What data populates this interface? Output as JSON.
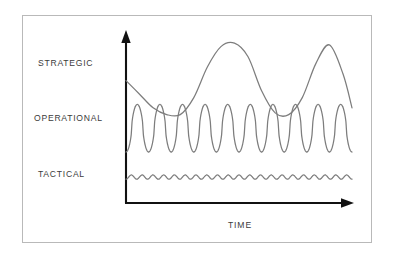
{
  "figure": {
    "background_color": "#ffffff",
    "frame_color": "#b9b9b9",
    "axis_color": "#111111",
    "curve_color": "#7d7d7d",
    "label_color": "#3b3b3b"
  },
  "labels": {
    "strategic": "STRATEGIC",
    "operational": "OPERATIONAL",
    "tactical": "TACTICAL",
    "time": "TIME"
  },
  "icons": {
    "y_axis_arrow": "arrow-up-icon",
    "x_axis_arrow": "arrow-right-icon"
  },
  "chart_data": {
    "type": "line",
    "title": "",
    "xlabel": "TIME",
    "ylabel": "",
    "grid": false,
    "legend": "inline-left-labels",
    "xlim": [
      0,
      1
    ],
    "ylim": [
      0,
      1
    ],
    "axis_arrows": {
      "x": "right",
      "y": "up"
    },
    "series": [
      {
        "name": "STRATEGIC",
        "label_y_level": 0.72,
        "description": "Low-frequency, high-amplitude long-wave cycle",
        "cycles": 2,
        "amplitude": "high",
        "frequency": "low",
        "x": [
          0.0,
          0.06,
          0.12,
          0.18,
          0.24,
          0.3,
          0.36,
          0.42,
          0.48,
          0.54,
          0.6,
          0.66,
          0.72,
          0.78,
          0.84,
          0.9,
          0.96,
          1.0
        ],
        "y": [
          0.72,
          0.64,
          0.56,
          0.52,
          0.52,
          0.62,
          0.8,
          0.92,
          0.94,
          0.86,
          0.66,
          0.53,
          0.52,
          0.62,
          0.82,
          0.93,
          0.76,
          0.56
        ]
      },
      {
        "name": "OPERATIONAL",
        "label_y_level": 0.44,
        "description": "Medium-frequency, medium-amplitude oscillation",
        "cycles": 10,
        "amplitude": "medium",
        "frequency": "medium",
        "baseline": 0.3,
        "peak": 0.58
      },
      {
        "name": "TACTICAL",
        "label_y_level": 0.14,
        "description": "High-frequency, very low-amplitude ripple",
        "cycles": 21,
        "amplitude": "low",
        "frequency": "high",
        "baseline": 0.14,
        "peak": 0.165
      }
    ]
  }
}
